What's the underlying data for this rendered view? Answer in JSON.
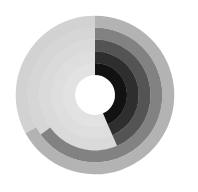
{
  "chart_data": {
    "type": "radial-bar",
    "title": "",
    "start_angle_deg": 0,
    "direction": "clockwise",
    "center": [
      95,
      95
    ],
    "inner_radius": 20,
    "ring_width": 11.8,
    "track_color": "#d9d9d9",
    "series": [
      {
        "name": "Ring 1",
        "value": 0.435,
        "color": "#121212",
        "track": "#e2e2e2"
      },
      {
        "name": "Ring 2",
        "value": 0.435,
        "color": "#2e2e2e",
        "track": "#dedede"
      },
      {
        "name": "Ring 3",
        "value": 0.435,
        "color": "#545454",
        "track": "#dadada"
      },
      {
        "name": "Ring 4",
        "value": 0.65,
        "color": "#828282",
        "track": "#d6d6d6"
      },
      {
        "name": "Ring 5",
        "value": 0.67,
        "color": "#b3b3b3",
        "track": "#d2d2d2"
      }
    ],
    "legend": "none",
    "grid": false
  }
}
